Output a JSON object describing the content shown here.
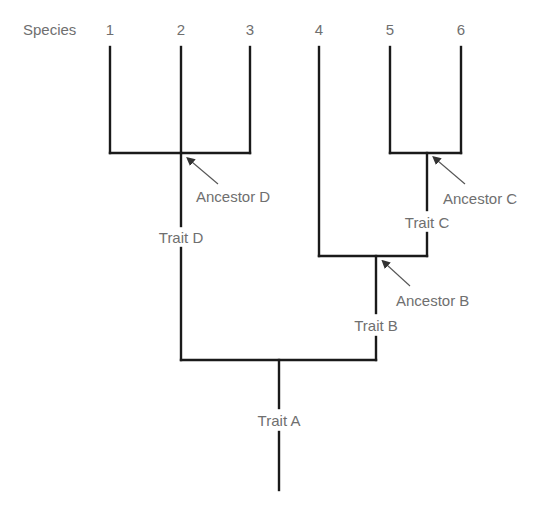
{
  "diagram": {
    "type": "cladogram",
    "header_label": "Species",
    "species": [
      {
        "label": "1",
        "x": 110
      },
      {
        "label": "2",
        "x": 181
      },
      {
        "label": "3",
        "x": 250
      },
      {
        "label": "4",
        "x": 319
      },
      {
        "label": "5",
        "x": 390
      },
      {
        "label": "6",
        "x": 461
      }
    ],
    "ancestors": [
      {
        "label": "Ancestor D",
        "groups": [
          "1",
          "2",
          "3"
        ]
      },
      {
        "label": "Ancestor C",
        "groups": [
          "5",
          "6"
        ]
      },
      {
        "label": "Ancestor B",
        "groups": [
          "4",
          "5",
          "6"
        ]
      }
    ],
    "traits": [
      {
        "label": "Trait D",
        "branch": "Ancestor D"
      },
      {
        "label": "Trait C",
        "branch": "Ancestor C"
      },
      {
        "label": "Trait B",
        "branch": "Ancestor B"
      },
      {
        "label": "Trait A",
        "branch": "root"
      }
    ],
    "colors": {
      "line": "#1a1a1a",
      "text": "#6f6f6f",
      "arrow": "#555555"
    }
  }
}
